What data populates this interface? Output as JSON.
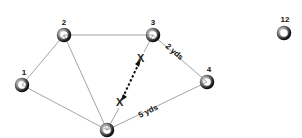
{
  "diagram": {
    "nodes": [
      {
        "id": "1",
        "label": "1",
        "x": 22,
        "y": 85
      },
      {
        "id": "2",
        "label": "2",
        "x": 64,
        "y": 35
      },
      {
        "id": "3",
        "label": "3",
        "x": 153,
        "y": 35
      },
      {
        "id": "4",
        "label": "4",
        "x": 207,
        "y": 82
      },
      {
        "id": "5",
        "label": "",
        "x": 107,
        "y": 130
      },
      {
        "id": "12",
        "label": "12",
        "x": 284,
        "y": 33
      }
    ],
    "edges": [
      {
        "from": "1",
        "to": "2",
        "label": ""
      },
      {
        "from": "1",
        "to": "5",
        "label": ""
      },
      {
        "from": "2",
        "to": "3",
        "label": ""
      },
      {
        "from": "2",
        "to": "5",
        "label": ""
      },
      {
        "from": "3",
        "to": "4",
        "label": "2 yds"
      },
      {
        "from": "4",
        "to": "5",
        "label": "5 yds"
      },
      {
        "from": "3",
        "to": "5",
        "label": ""
      }
    ],
    "edge_labels": {
      "e34": "2 yds",
      "e45": "5 yds"
    },
    "annotation": {
      "type": "dashed-arrow-between-x-marks",
      "start_mark": "X",
      "end_mark": "X",
      "start": {
        "x": 141,
        "y": 58
      },
      "end": {
        "x": 121,
        "y": 102
      }
    },
    "colors": {
      "edge": "#9a9a9a",
      "text": "#111111",
      "node_dark": "#1a1a1a",
      "node_light": "#f0f0f0"
    }
  }
}
